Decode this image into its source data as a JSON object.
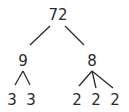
{
  "diagram": {
    "type": "factor-tree",
    "root": {
      "value": "72",
      "children": [
        {
          "value": "9",
          "children": [
            {
              "value": "3"
            },
            {
              "value": "3"
            }
          ]
        },
        {
          "value": "8",
          "children": [
            {
              "value": "2"
            },
            {
              "value": "2"
            },
            {
              "value": "2"
            }
          ]
        }
      ]
    },
    "labels": {
      "root": "72",
      "left": "9",
      "right": "8",
      "left_children": [
        "3",
        "3"
      ],
      "right_children": [
        "2",
        "2",
        "2"
      ]
    },
    "colors": {
      "ink": "#2a2a2a",
      "background": "#ffffff"
    }
  }
}
